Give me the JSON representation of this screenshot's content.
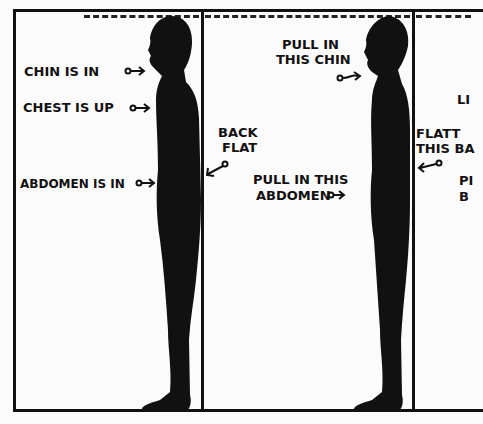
{
  "panels": [
    {
      "id": "good-posture",
      "labels": {
        "chin": "CHIN IS IN",
        "chest": "CHEST IS UP",
        "abdomen": "ABDOMEN IS IN"
      }
    },
    {
      "id": "corrections",
      "labels": {
        "chin_line1": "PULL IN",
        "chin_line2": "THIS CHIN",
        "back_line1": "BACK",
        "back_line2": "FLAT",
        "abdomen_line1": "PULL IN THIS",
        "abdomen_line2": "ABDOMEN"
      }
    },
    {
      "id": "partial",
      "labels": {
        "l1": "LI",
        "flat_line1": "FLATT",
        "flat_line2": "THIS BA",
        "p1": "PI",
        "p2": "B"
      }
    }
  ],
  "colors": {
    "ink": "#111111",
    "paper": "#fbfbfb"
  }
}
